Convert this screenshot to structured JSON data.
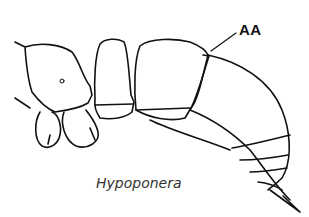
{
  "diagram": {
    "annotation_label": "AA",
    "caption": "Hypoponera",
    "line_color": "#111111",
    "background": "#ffffff"
  }
}
